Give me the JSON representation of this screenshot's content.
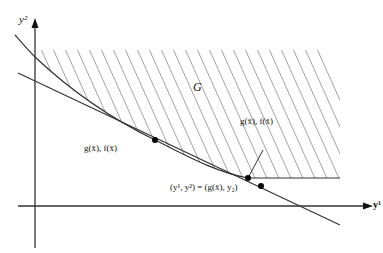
{
  "diagram": {
    "axes": {
      "x_label": "y¹",
      "y_label": "y²"
    },
    "region_label": "G",
    "points": [
      {
        "id": "tangent-point",
        "label": "g(x̄), f(x̄)"
      },
      {
        "id": "curve-point",
        "label": "g(x̄), f(x̄)"
      },
      {
        "id": "line-point",
        "label": "(y¹, y²) = (g(x̄), y₂)"
      }
    ],
    "colors": {
      "stroke": "#333333",
      "hatch": "#8a8a8a",
      "point": "#000000"
    }
  }
}
